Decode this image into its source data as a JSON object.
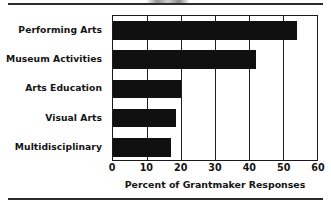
{
  "chart_data": {
    "type": "bar",
    "orientation": "horizontal",
    "title": "",
    "xlabel": "Percent of Grantmaker Responses",
    "ylabel": "",
    "categories": [
      "Performing Arts",
      "Museum Activities",
      "Arts Education",
      "Visual Arts",
      "Multidisciplinary"
    ],
    "values": [
      54,
      42,
      20,
      18.5,
      17
    ],
    "xlim": [
      0,
      60
    ],
    "xticks": [
      0,
      10,
      20,
      30,
      40,
      50,
      60
    ],
    "xtick_labels": [
      "0",
      "10",
      "20",
      "30",
      "40",
      "50",
      "60"
    ],
    "grid": "vertical",
    "legend": "none",
    "bar_color": "#101010",
    "axis_color": "#1a1a1a"
  },
  "figure": {
    "top_rule": "",
    "bottom_rule": "",
    "cropped_header_artifact": ""
  }
}
